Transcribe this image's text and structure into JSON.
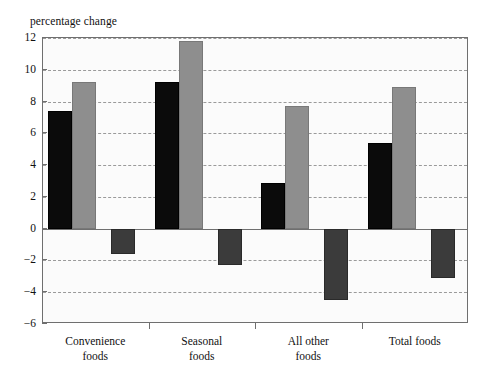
{
  "chart": {
    "type": "bar",
    "axis_title": "percentage change"
  },
  "chart_data": {
    "type": "bar",
    "title": "",
    "axis_title": "percentage change",
    "xlabel": "",
    "ylabel": "percentage change",
    "ylim": [
      -6,
      12
    ],
    "ytick_values": [
      12,
      10,
      8,
      6,
      4,
      2,
      0,
      -2,
      -4,
      -6
    ],
    "ytick_labels": [
      "12",
      "10",
      "8",
      "6",
      "4",
      "2",
      "0",
      "−2",
      "−4",
      "−6"
    ],
    "grid": true,
    "legend": "none",
    "categories": [
      "Convenience foods",
      "Seasonal foods",
      "All other foods",
      "Total foods"
    ],
    "category_lines": [
      [
        "Convenience",
        "foods"
      ],
      [
        "Seasonal",
        "foods"
      ],
      [
        "All other",
        "foods"
      ],
      [
        "Total foods"
      ]
    ],
    "series": [
      {
        "name": "series-1",
        "color": "#0b0b0b",
        "values": [
          7.4,
          9.2,
          2.9,
          5.4
        ]
      },
      {
        "name": "series-2",
        "color": "#8e8e8e",
        "values": [
          9.2,
          11.8,
          7.7,
          8.9
        ]
      },
      {
        "name": "series-3",
        "color": "#3b3b3b",
        "values": [
          -1.6,
          -2.3,
          -4.5,
          -3.1
        ]
      }
    ]
  }
}
